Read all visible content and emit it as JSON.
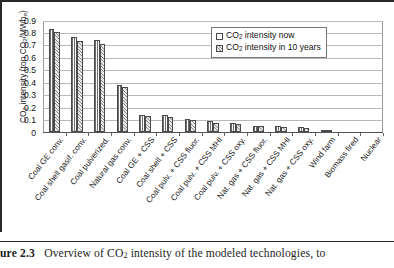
{
  "figure": {
    "caption_label": "ure 2.3",
    "caption_text": "Overview of CO",
    "caption_sub": "2",
    "caption_tail": " intensity of the modeled technologies, to"
  },
  "legend": {
    "position": "top-right",
    "items": [
      {
        "label_pre": "CO",
        "label_sub": "2",
        "label_post": " intensity now",
        "pattern": "vertical-hatch"
      },
      {
        "label_pre": "CO",
        "label_sub": "2",
        "label_post": " intensity in 10 years",
        "pattern": "diagonal-hatch"
      }
    ]
  },
  "chart_data": {
    "type": "bar",
    "title": "",
    "xlabel": "",
    "ylabel_pre": "CO",
    "ylabel_sub": "2",
    "ylabel_mid": " intensity (ton CO",
    "ylabel_sub2": "2",
    "ylabel_post": "/MWh",
    "ylabel_sub3": "e",
    "ylabel_close": ")",
    "ylim": [
      0,
      0.9
    ],
    "ytick_values": [
      "0",
      "0.1",
      "0.2",
      "0.3",
      "0.4",
      "0.5",
      "0.6",
      "0.7",
      "0.8",
      "0.9"
    ],
    "grid": true,
    "categories": [
      "Coal GE conv.",
      "Coal shell gasif. conv.",
      "Coal pulverized.",
      "Natural gas conv.",
      "Coal GE + CSS",
      "Coal shell + CSS",
      "Coal pulv. + CSS fluor.",
      "Coal pulv. + CSS MHI",
      "Coal pulv. + CSS oxy.",
      "Nat. gas + CSS fluor.",
      "Nat. gas + CSS MHI",
      "Nat. gas + CSS oxy.",
      "Wind farm",
      "Biomass fired",
      "Nuclear"
    ],
    "series": [
      {
        "name": "CO2 intensity now",
        "values": [
          0.83,
          0.76,
          0.74,
          0.38,
          0.14,
          0.135,
          0.105,
          0.085,
          0.075,
          0.05,
          0.045,
          0.04,
          0.005,
          0.0,
          0.0
        ]
      },
      {
        "name": "CO2 intensity in 10 years",
        "values": [
          0.8,
          0.73,
          0.71,
          0.36,
          0.125,
          0.12,
          0.095,
          0.075,
          0.065,
          0.045,
          0.04,
          0.035,
          0.004,
          0.0,
          0.0
        ]
      }
    ]
  }
}
